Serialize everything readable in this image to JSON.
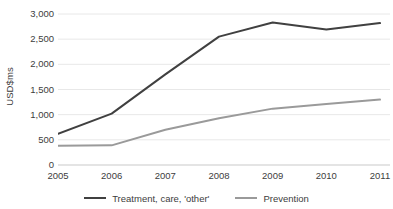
{
  "chart_data": {
    "type": "line",
    "title": "",
    "subtitle": "",
    "xlabel": "",
    "ylabel": "USD$ms",
    "categories": [
      "2005",
      "2006",
      "2007",
      "2008",
      "2009",
      "2010",
      "2011"
    ],
    "x": [
      2005,
      2006,
      2007,
      2008,
      2009,
      2010,
      2011
    ],
    "series": [
      {
        "name": "Treatment, care, 'other'",
        "color": "#404040",
        "values": [
          620,
          1020,
          1800,
          2550,
          2830,
          2690,
          2820
        ]
      },
      {
        "name": "Prevention",
        "color": "#9a9a9a",
        "values": [
          380,
          390,
          700,
          930,
          1120,
          1210,
          1300
        ]
      }
    ],
    "ylim": [
      0,
      3000
    ],
    "y_ticks": [
      0,
      500,
      1000,
      1500,
      2000,
      2500,
      3000
    ],
    "y_tick_labels": [
      "0",
      "500",
      "1,000",
      "1,500",
      "2,000",
      "2,500",
      "3,000"
    ],
    "grid": true,
    "grid_color": "#e8e8e8",
    "axis_color": "#c9c9c9",
    "legend_position": "bottom",
    "background": "#ffffff"
  },
  "legend": {
    "items": [
      {
        "label": "Treatment, care, 'other'",
        "color": "#404040"
      },
      {
        "label": "Prevention",
        "color": "#9a9a9a"
      }
    ]
  }
}
